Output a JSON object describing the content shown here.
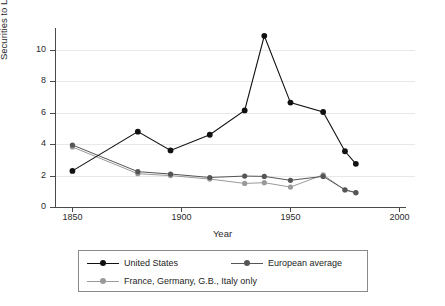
{
  "chart_data": {
    "type": "line",
    "title": "",
    "xlabel": "Year",
    "ylabel": "Securities to Loans Ratio",
    "xlim": [
      1842,
      2003
    ],
    "ylim": [
      0,
      11.4
    ],
    "xticks": [
      1850,
      1900,
      1950,
      2000
    ],
    "yticks": [
      0,
      2,
      4,
      6,
      8,
      10
    ],
    "grid": "horizontal",
    "legend_position": "below-plot",
    "series": [
      {
        "name": "United States",
        "color": "#111111",
        "marker": "circle",
        "x": [
          1850,
          1880,
          1895,
          1913,
          1929,
          1938,
          1950,
          1965,
          1975,
          1980
        ],
        "values": [
          2.3,
          4.8,
          3.6,
          4.6,
          6.15,
          10.9,
          6.65,
          6.05,
          3.55,
          2.75
        ]
      },
      {
        "name": "European average",
        "color": "#555555",
        "marker": "circle",
        "x": [
          1850,
          1880,
          1895,
          1913,
          1929,
          1938,
          1950,
          1965,
          1975,
          1980
        ],
        "values": [
          3.95,
          2.25,
          2.1,
          1.88,
          1.97,
          1.95,
          1.7,
          1.95,
          1.1,
          0.92
        ]
      },
      {
        "name": "France, Germany, G.B., Italy only",
        "color": "#9a9a9a",
        "marker": "circle",
        "x": [
          1850,
          1880,
          1895,
          1913,
          1929,
          1938,
          1950,
          1965,
          1975,
          1980
        ],
        "values": [
          3.82,
          2.12,
          2.0,
          1.78,
          1.5,
          1.55,
          1.27,
          2.05,
          1.08,
          0.9
        ]
      }
    ]
  },
  "axes": {
    "y_title": "Securities to Loans Ratio",
    "x_title": "Year",
    "y_tick_labels": [
      "0",
      "2",
      "4",
      "6",
      "8",
      "10"
    ],
    "x_tick_labels": [
      "1850",
      "1900",
      "1950",
      "2000"
    ]
  },
  "legend": {
    "entries": [
      {
        "label": "United States",
        "color": "#111111"
      },
      {
        "label": "European average",
        "color": "#555555"
      },
      {
        "label": "France, Germany, G.B., Italy only",
        "color": "#9a9a9a"
      }
    ]
  }
}
